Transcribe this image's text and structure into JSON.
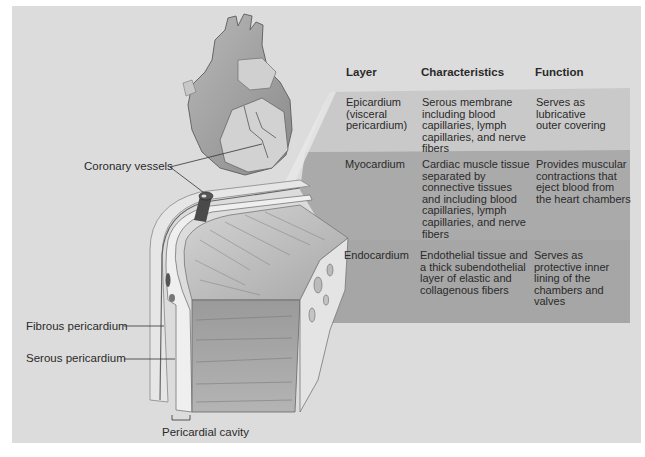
{
  "figure": {
    "labels": {
      "coronary_vessels": "Coronary vessels",
      "fibrous_pericardium": "Fibrous pericardium",
      "serous_pericardium": "Serous pericardium",
      "pericardial_cavity": "Pericardial cavity"
    },
    "colors": {
      "background": "#dcdcdc",
      "epicardium_band": "#c9c9c9",
      "myocardium_band": "#a9a9a9",
      "endocardium_band": "#a6a6a6"
    }
  },
  "table": {
    "headers": [
      "Layer",
      "Characteristics",
      "Function"
    ],
    "rows": [
      {
        "layer": "Epicardium\n (visceral\n pericardium)",
        "characteristics": "Serous membrane\nincluding blood\ncapillaries, lymph\ncapillaries, and nerve\nfibers",
        "function": "Serves as\nlubricative\nouter covering"
      },
      {
        "layer": "Myocardium",
        "characteristics": "Cardiac muscle tissue\nseparated by\nconnective tissues\nand including blood\ncapillaries, lymph\ncapillaries, and nerve\nfibers",
        "function": "Provides muscular\ncontractions that\neject blood from\nthe heart chambers"
      },
      {
        "layer": "Endocardium",
        "characteristics": "Endothelial tissue and\na thick subendothelial\nlayer of elastic and\ncollagenous fibers",
        "function": "Serves as\nprotective inner\nlining of the\nchambers and\nvalves"
      }
    ]
  }
}
